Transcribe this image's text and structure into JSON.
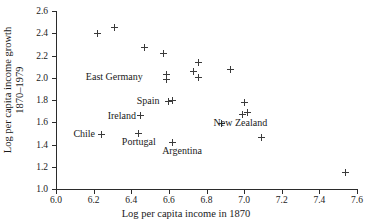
{
  "chart_data": {
    "type": "scatter",
    "title": "",
    "xlabel": "Log per capita income in 1870",
    "ylabel_line1": "Log per capita income growth",
    "ylabel_line2": "1870–1979",
    "xlim": [
      6.0,
      7.6
    ],
    "ylim": [
      1.0,
      2.6
    ],
    "xticks": [
      "6.0",
      "6.2",
      "6.4",
      "6.6",
      "6.8",
      "7.0",
      "7.2",
      "7.4",
      "7.6"
    ],
    "yticks": [
      "1.0",
      "1.2",
      "1.4",
      "1.6",
      "1.8",
      "2.0",
      "2.2",
      "2.4",
      "2.6"
    ],
    "xtick_values": [
      6.0,
      6.2,
      6.4,
      6.6,
      6.8,
      7.0,
      7.2,
      7.4,
      7.6
    ],
    "ytick_values": [
      1.0,
      1.2,
      1.4,
      1.6,
      1.8,
      2.0,
      2.2,
      2.4,
      2.6
    ],
    "grid": false,
    "legend": "none",
    "marker": "plus",
    "marker_color": "#3b3b3b",
    "points": [
      {
        "x": 6.22,
        "y": 2.4
      },
      {
        "x": 6.31,
        "y": 2.45
      },
      {
        "x": 6.47,
        "y": 2.27
      },
      {
        "x": 6.57,
        "y": 2.22
      },
      {
        "x": 6.59,
        "y": 2.03
      },
      {
        "x": 6.59,
        "y": 1.98
      },
      {
        "x": 6.73,
        "y": 2.06
      },
      {
        "x": 6.76,
        "y": 2.14
      },
      {
        "x": 6.76,
        "y": 2.0
      },
      {
        "x": 6.93,
        "y": 2.07
      },
      {
        "x": 6.6,
        "y": 1.79
      },
      {
        "x": 6.62,
        "y": 1.8
      },
      {
        "x": 6.45,
        "y": 1.66
      },
      {
        "x": 7.0,
        "y": 1.78
      },
      {
        "x": 6.99,
        "y": 1.67
      },
      {
        "x": 7.02,
        "y": 1.69
      },
      {
        "x": 6.88,
        "y": 1.59
      },
      {
        "x": 6.24,
        "y": 1.49
      },
      {
        "x": 6.44,
        "y": 1.5
      },
      {
        "x": 6.62,
        "y": 1.42
      },
      {
        "x": 7.09,
        "y": 1.46
      },
      {
        "x": 7.54,
        "y": 1.15
      }
    ],
    "annotations": [
      {
        "label": "East Germany",
        "x": 6.31,
        "y": 2.01
      },
      {
        "label": "Spain",
        "x": 6.49,
        "y": 1.79
      },
      {
        "label": "Ireland",
        "x": 6.35,
        "y": 1.66
      },
      {
        "label": "Chile",
        "x": 6.15,
        "y": 1.49
      },
      {
        "label": "Portugal",
        "x": 6.44,
        "y": 1.42
      },
      {
        "label": "Argentina",
        "x": 6.67,
        "y": 1.34
      },
      {
        "label": "New Zealand",
        "x": 6.98,
        "y": 1.59
      }
    ]
  }
}
